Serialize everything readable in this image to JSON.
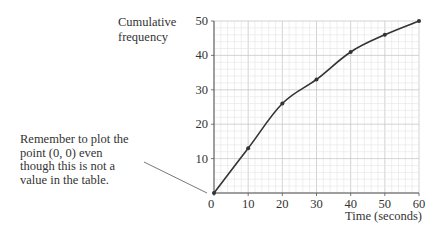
{
  "chart_data": {
    "type": "line",
    "title": "",
    "xlabel": "Time (seconds)",
    "ylabel": "Cumulative frequency",
    "x": [
      0,
      10,
      20,
      30,
      40,
      50,
      60
    ],
    "series": [
      {
        "name": "Cumulative frequency",
        "values": [
          0,
          13,
          26,
          33,
          41,
          46,
          50
        ]
      }
    ],
    "xlim": [
      0,
      60
    ],
    "ylim": [
      0,
      50
    ],
    "x_ticks": [
      "0",
      "10",
      "20",
      "30",
      "40",
      "50",
      "60"
    ],
    "y_ticks": [
      "10",
      "20",
      "30",
      "40",
      "50"
    ],
    "grid": true,
    "minor_grid_step": 2,
    "legend": "none",
    "annotation": {
      "text": "Remember to plot the point (0, 0) even though this is not a value in the table.",
      "points_to": [
        0,
        0
      ]
    },
    "colors": {
      "line": "#333333",
      "grid_minor": "#e4e4e4",
      "grid_major": "#c8c8c8",
      "axis": "#555555"
    }
  },
  "labels": {
    "ylabel_line1": "Cumulative",
    "ylabel_line2": "frequency",
    "xlabel": "Time (seconds)",
    "note_line1": "Remember to plot the",
    "note_line2": "point (0, 0) even",
    "note_line3": "though this is not a",
    "note_line4": "value in the table."
  }
}
